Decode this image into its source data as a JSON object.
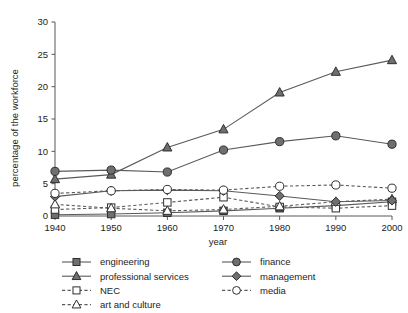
{
  "chart_data": {
    "type": "line",
    "title": "",
    "xlabel": "year",
    "ylabel": "percentage of the workforce",
    "x": [
      1940,
      1950,
      1960,
      1970,
      1980,
      1990,
      2000
    ],
    "categories": [
      "1940",
      "1950",
      "1960",
      "1970",
      "1980",
      "1990",
      "2000"
    ],
    "xlim": [
      1940,
      2000
    ],
    "ylim": [
      0,
      30
    ],
    "yticks": [
      0,
      5,
      10,
      15,
      20,
      25,
      30
    ],
    "ytick_labels": [
      "0",
      "5",
      "10",
      "15",
      "20",
      "25",
      "30"
    ],
    "grid": false,
    "legend_position": "below-plot",
    "series": [
      {
        "name": "engineering",
        "values": [
          0.2,
          0.3,
          0.5,
          0.8,
          1.2,
          1.6,
          2.2
        ],
        "marker": "filled-square",
        "line": "solid",
        "color": "#6b6b6b"
      },
      {
        "name": "professional services",
        "values": [
          5.7,
          6.4,
          10.6,
          13.4,
          19.1,
          22.3,
          24.1
        ],
        "marker": "filled-triangle",
        "line": "solid",
        "color": "#6b6b6b"
      },
      {
        "name": "NEC",
        "values": [
          1.0,
          1.3,
          2.1,
          2.9,
          1.4,
          1.2,
          1.6
        ],
        "marker": "open-square",
        "line": "dashed",
        "color": "#6b6b6b"
      },
      {
        "name": "art and culture",
        "values": [
          1.8,
          1.2,
          0.8,
          1.0,
          1.5,
          2.2,
          2.6
        ],
        "marker": "open-triangle",
        "line": "dashed",
        "color": "#6b6b6b"
      },
      {
        "name": "finance",
        "values": [
          6.9,
          7.1,
          6.8,
          10.2,
          11.5,
          12.4,
          11.1
        ],
        "marker": "filled-circle",
        "line": "solid",
        "color": "#6b6b6b"
      },
      {
        "name": "management",
        "values": [
          3.0,
          3.9,
          4.0,
          3.9,
          3.1,
          2.2,
          2.4
        ],
        "marker": "filled-diamond",
        "line": "solid",
        "color": "#6b6b6b"
      },
      {
        "name": "media",
        "values": [
          3.5,
          3.9,
          4.1,
          4.0,
          4.6,
          4.8,
          4.3
        ],
        "marker": "open-circle",
        "line": "dashed",
        "color": "#6b6b6b"
      }
    ]
  },
  "legend": {
    "columns": [
      {
        "items": [
          {
            "label": "engineering",
            "series": "engineering"
          },
          {
            "label": "professional services",
            "series": "professional services"
          },
          {
            "label": "NEC",
            "series": "NEC"
          },
          {
            "label": "art and culture",
            "series": "art and culture"
          }
        ]
      },
      {
        "items": [
          {
            "label": "finance",
            "series": "finance"
          },
          {
            "label": "management",
            "series": "management"
          },
          {
            "label": "media",
            "series": "media"
          }
        ]
      }
    ]
  },
  "colors": {
    "marker_fill": "#6f6f6f",
    "marker_stroke": "#2e2e2e",
    "line": "#5a5a5a",
    "axis": "#585858",
    "text": "#1d1d1d",
    "background": "#ffffff"
  }
}
